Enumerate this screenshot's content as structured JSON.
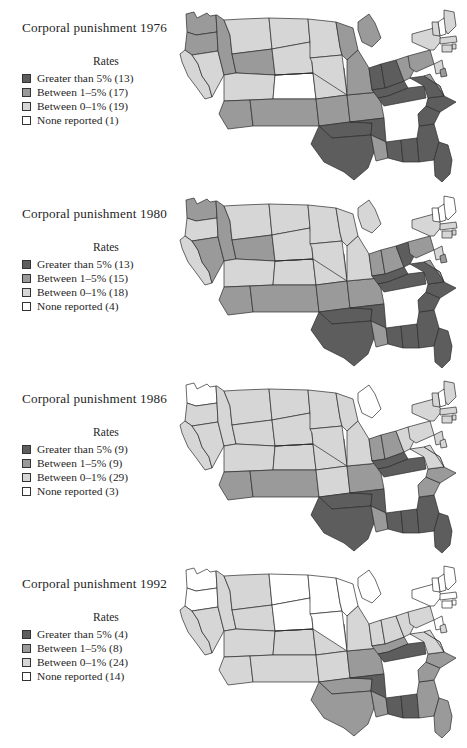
{
  "figure": {
    "colors": {
      "greater_than_5": "#5d5d5d",
      "between_1_5": "#9a9a9a",
      "between_0_1": "#d6d6d6",
      "none_reported": "#ffffff",
      "outline": "#2b2b2b",
      "text": "#1f1f1f"
    }
  },
  "chart_data": {
    "type": "map",
    "map_region": "United States (contiguous 48 states)",
    "legend_position": "left",
    "categories": [
      "Greater than 5%",
      "Between 1–5%",
      "Between 0–1%",
      "None reported"
    ],
    "panels": [
      {
        "year": "1976",
        "title": "Corporal punishment 1976",
        "legend_heading": "Rates",
        "legend": [
          {
            "label": "Greater than 5% (13)",
            "category": "Greater than 5%",
            "count": 13,
            "color": "#5d5d5d"
          },
          {
            "label": "Between 1–5% (17)",
            "category": "Between 1–5%",
            "count": 17,
            "color": "#9a9a9a"
          },
          {
            "label": "Between 0–1% (19)",
            "category": "Between 0–1%",
            "count": 19,
            "color": "#d6d6d6"
          },
          {
            "label": "None reported (1)",
            "category": "None reported",
            "count": 1,
            "color": "#ffffff"
          }
        ],
        "state_levels": {
          "WA": 2,
          "OR": 2,
          "CA": 1,
          "NV": 1,
          "ID": 2,
          "MT": 1,
          "WY": 2,
          "UT": 1,
          "AZ": 2,
          "CO": 0,
          "NM": 2,
          "ND": 1,
          "SD": 1,
          "NE": 1,
          "KS": 2,
          "OK": 3,
          "TX": 3,
          "MN": 1,
          "IA": 1,
          "MO": 2,
          "AR": 3,
          "LA": 2,
          "WI": 2,
          "IL": 2,
          "MS": 3,
          "AL": 3,
          "MI": 2,
          "IN": 3,
          "KY": 3,
          "TN": 3,
          "OH": 3,
          "WV": 2,
          "GA": 3,
          "FL": 3,
          "SC": 3,
          "NC": 3,
          "VA": 3,
          "PA": 2,
          "NY": 1,
          "ME": 1,
          "NH": 0,
          "VT": 1,
          "MA": 1,
          "RI": 1,
          "CT": 1,
          "NJ": 1,
          "DE": 2,
          "MD": 2
        }
      },
      {
        "year": "1980",
        "title": "Corporal punishment 1980",
        "legend_heading": "Rates",
        "legend": [
          {
            "label": "Greater than 5% (13)",
            "category": "Greater than 5%",
            "count": 13,
            "color": "#5d5d5d"
          },
          {
            "label": "Between 1–5% (15)",
            "category": "Between 1–5%",
            "count": 15,
            "color": "#9a9a9a"
          },
          {
            "label": "Between 0–1% (18)",
            "category": "Between 0–1%",
            "count": 18,
            "color": "#d6d6d6"
          },
          {
            "label": "None reported (4)",
            "category": "None reported",
            "count": 4,
            "color": "#ffffff"
          }
        ],
        "state_levels": {
          "WA": 2,
          "OR": 1,
          "CA": 1,
          "NV": 2,
          "ID": 2,
          "MT": 1,
          "WY": 2,
          "UT": 1,
          "AZ": 2,
          "CO": 1,
          "NM": 2,
          "ND": 1,
          "SD": 1,
          "NE": 1,
          "KS": 2,
          "OK": 3,
          "TX": 3,
          "MN": 1,
          "IA": 1,
          "MO": 2,
          "AR": 3,
          "LA": 2,
          "WI": 1,
          "IL": 1,
          "MS": 3,
          "AL": 3,
          "MI": 1,
          "IN": 2,
          "KY": 3,
          "TN": 3,
          "OH": 2,
          "WV": 3,
          "GA": 3,
          "FL": 3,
          "SC": 3,
          "NC": 3,
          "VA": 3,
          "PA": 2,
          "NY": 1,
          "ME": 0,
          "NH": 0,
          "VT": 0,
          "MA": 1,
          "RI": 1,
          "CT": 1,
          "NJ": 1,
          "DE": 2,
          "MD": 2
        }
      },
      {
        "year": "1986",
        "title": "Corporal punishment 1986",
        "legend_heading": "Rates",
        "legend": [
          {
            "label": "Greater than 5% (9)",
            "category": "Greater than 5%",
            "count": 9,
            "color": "#5d5d5d"
          },
          {
            "label": "Between 1–5% (9)",
            "category": "Between 1–5%",
            "count": 9,
            "color": "#9a9a9a"
          },
          {
            "label": "Between 0–1% (29)",
            "category": "Between 0–1%",
            "count": 29,
            "color": "#d6d6d6"
          },
          {
            "label": "None reported (3)",
            "category": "None reported",
            "count": 3,
            "color": "#ffffff"
          }
        ],
        "state_levels": {
          "WA": 0,
          "OR": 1,
          "CA": 1,
          "NV": 1,
          "ID": 1,
          "MT": 1,
          "WY": 1,
          "UT": 1,
          "AZ": 2,
          "CO": 1,
          "NM": 2,
          "ND": 1,
          "SD": 1,
          "NE": 1,
          "KS": 1,
          "OK": 3,
          "TX": 3,
          "MN": 1,
          "IA": 1,
          "MO": 2,
          "AR": 3,
          "LA": 2,
          "WI": 1,
          "IL": 1,
          "MS": 3,
          "AL": 3,
          "MI": 0,
          "IN": 2,
          "KY": 3,
          "TN": 3,
          "OH": 2,
          "WV": 1,
          "GA": 3,
          "FL": 3,
          "SC": 2,
          "NC": 2,
          "VA": 1,
          "PA": 1,
          "NY": 1,
          "ME": 1,
          "NH": 0,
          "VT": 1,
          "MA": 1,
          "RI": 1,
          "CT": 1,
          "NJ": 1,
          "DE": 1,
          "MD": 1
        }
      },
      {
        "year": "1992",
        "title": "Corporal punishment 1992",
        "legend_heading": "Rates",
        "legend": [
          {
            "label": "Greater than 5% (4)",
            "category": "Greater than 5%",
            "count": 4,
            "color": "#5d5d5d"
          },
          {
            "label": "Between 1–5% (8)",
            "category": "Between 1–5%",
            "count": 8,
            "color": "#9a9a9a"
          },
          {
            "label": "Between 0–1% (24)",
            "category": "Between 0–1%",
            "count": 24,
            "color": "#d6d6d6"
          },
          {
            "label": "None reported (14)",
            "category": "None reported",
            "count": 14,
            "color": "#ffffff"
          }
        ],
        "state_levels": {
          "WA": 0,
          "OR": 0,
          "CA": 1,
          "NV": 1,
          "ID": 1,
          "MT": 1,
          "WY": 1,
          "UT": 1,
          "AZ": 1,
          "CO": 1,
          "NM": 1,
          "ND": 0,
          "SD": 0,
          "NE": 1,
          "KS": 1,
          "OK": 2,
          "TX": 2,
          "MN": 0,
          "IA": 0,
          "MO": 2,
          "AR": 3,
          "LA": 2,
          "WI": 0,
          "IL": 1,
          "MS": 3,
          "AL": 3,
          "MI": 0,
          "IN": 1,
          "KY": 2,
          "TN": 3,
          "OH": 1,
          "WV": 1,
          "GA": 2,
          "FL": 2,
          "SC": 2,
          "NC": 2,
          "VA": 1,
          "PA": 1,
          "NY": 0,
          "ME": 0,
          "NH": 0,
          "VT": 0,
          "MA": 0,
          "RI": 0,
          "CT": 0,
          "NJ": 0,
          "DE": 1,
          "MD": 1
        }
      }
    ]
  }
}
